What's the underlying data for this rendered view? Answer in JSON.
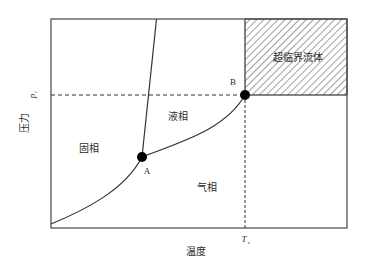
{
  "diagram": {
    "type": "phase-diagram",
    "colors": {
      "line": "#333333",
      "frame": "#555555",
      "hatch": "#444444",
      "point": "#000000",
      "background": "#ffffff"
    },
    "axes": {
      "x_label": "温度",
      "y_label": "压力",
      "critical_temperature": {
        "symbol": "T",
        "subscript": "c"
      },
      "critical_pressure": {
        "symbol": "p",
        "subscript": "c"
      }
    },
    "regions": {
      "solid": "固相",
      "liquid": "液相",
      "gas": "气相",
      "supercritical": "超临界流体"
    },
    "points": {
      "triple_point": {
        "label": "A"
      },
      "critical_point": {
        "label": "B"
      }
    }
  }
}
